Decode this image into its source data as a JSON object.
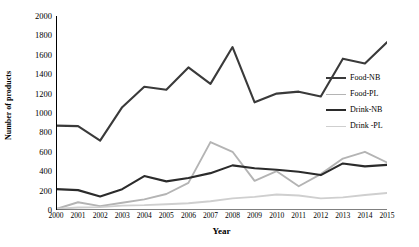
{
  "chart_data": {
    "type": "line",
    "title": "",
    "xlabel": "Year",
    "ylabel": "Number of products",
    "categories": [
      "2000",
      "2001",
      "2002",
      "2003",
      "2004",
      "2005",
      "2006",
      "2007",
      "2008",
      "2009",
      "2010",
      "2011",
      "2012",
      "2013",
      "2014",
      "2015"
    ],
    "x": [
      2000,
      2001,
      2002,
      2003,
      2004,
      2005,
      2006,
      2007,
      2008,
      2009,
      2010,
      2011,
      2012,
      2013,
      2014,
      2015
    ],
    "ylim": [
      0,
      2000
    ],
    "yticks": [
      0,
      200,
      400,
      600,
      800,
      1000,
      1200,
      1400,
      1600,
      1800,
      2000
    ],
    "ytick_labels": [
      "0",
      "200",
      "400",
      "600",
      "800",
      "1000",
      "1200",
      "1400",
      "1600",
      "1800",
      "2000"
    ],
    "grid": false,
    "legend_position": "right",
    "series": [
      {
        "name": "Food-NB",
        "color": "#3a3a3a",
        "width": 2.1,
        "values": [
          870,
          865,
          715,
          1060,
          1270,
          1240,
          1470,
          1300,
          1680,
          1110,
          1200,
          1220,
          1170,
          1560,
          1510,
          1730
        ]
      },
      {
        "name": "Food-PL",
        "color": "#b4b4b4",
        "width": 1.9,
        "values": [
          10,
          80,
          40,
          75,
          110,
          165,
          280,
          700,
          600,
          300,
          400,
          245,
          370,
          530,
          600,
          490
        ]
      },
      {
        "name": "Drink-NB",
        "color": "#2b2b2b",
        "width": 2.1,
        "values": [
          215,
          205,
          140,
          215,
          350,
          295,
          330,
          380,
          460,
          430,
          415,
          395,
          360,
          480,
          450,
          465
        ]
      },
      {
        "name": "Drink -PL",
        "color": "#cfcfcf",
        "width": 1.9,
        "values": [
          10,
          25,
          30,
          45,
          50,
          60,
          70,
          90,
          120,
          135,
          160,
          150,
          120,
          130,
          155,
          175
        ]
      }
    ]
  },
  "legend": {
    "items": [
      {
        "label": "Food-NB"
      },
      {
        "label": "Food-PL"
      },
      {
        "label": "Drink-NB"
      },
      {
        "label": "Drink -PL"
      }
    ]
  },
  "axes": {
    "y_title": "Number of products",
    "x_title": "Year",
    "axis_color": "#000000"
  }
}
